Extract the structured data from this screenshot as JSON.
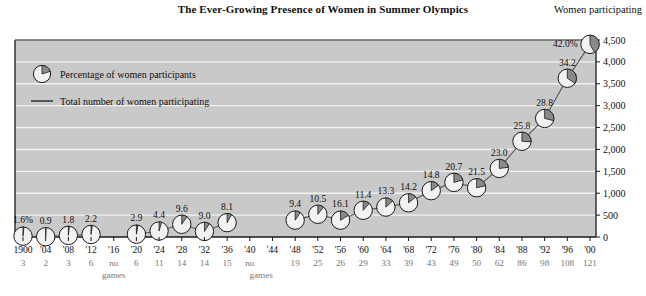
{
  "title": "The Ever-Growing Presence of Women in Summer Olympics",
  "right_axis_header": "Women participating",
  "legend": [
    {
      "key": "pie",
      "label": "Percentage of women participants"
    },
    {
      "key": "line",
      "label": "Total number of women participating"
    }
  ],
  "no_games_label": "no",
  "no_games_label2": "games",
  "colors": {
    "plot_background": "#c9c9c9",
    "gridline": "#f2f2f2",
    "axis": "#1a1a1a",
    "pie_slice": "#8a8a8a",
    "pie_face": "#f2f2f2",
    "series_line": "#555555",
    "text": "#111111",
    "events_text": "#777777"
  },
  "chart_data": {
    "type": "line",
    "title": "The Ever-Growing Presence of Women in Summer Olympics",
    "xlabel": "",
    "ylabel": "Women participating",
    "ylim": [
      0,
      4500
    ],
    "yticks": [
      0,
      500,
      1000,
      1500,
      2000,
      2500,
      3000,
      3500,
      4000,
      4500
    ],
    "ytick_labels": [
      "0",
      "500",
      "1,000",
      "1,500",
      "2,000",
      "2,500",
      "3,000",
      "3,500",
      "4,000",
      "4,500"
    ],
    "grid": true,
    "legend_position": "upper-left-inside",
    "categories": [
      "1900",
      "'04",
      "'08",
      "'12",
      "'16",
      "'20",
      "'24",
      "'28",
      "'32",
      "'36",
      "'40",
      "'44",
      "'48",
      "'52",
      "'56",
      "'60",
      "'64",
      "'68",
      "'72",
      "'76",
      "'80",
      "'84",
      "'88",
      "'92",
      "'96",
      "'00"
    ],
    "series": [
      {
        "name": "Total number of women participating",
        "values": [
          19,
          6,
          36,
          57,
          null,
          64,
          136,
          290,
          127,
          328,
          null,
          null,
          385,
          518,
          384,
          610,
          683,
          781,
          1058,
          1247,
          1125,
          1566,
          2186,
          2708,
          3626,
          4400
        ]
      }
    ],
    "annotations": {
      "name": "Percentage of women participants",
      "labels": [
        "1.6%",
        "0.9",
        "1.8",
        "2.2",
        null,
        "2.9",
        "4.4",
        "9.6",
        "9.0",
        "8.1",
        null,
        null,
        "9.4",
        "10.5",
        "16.1",
        "11.4",
        "13.3",
        "14.2",
        "14.8",
        "20.7",
        "21.5",
        "23.0",
        "25.8",
        "28.8",
        "34.2",
        "42.0%"
      ],
      "values": [
        1.6,
        0.9,
        1.8,
        2.2,
        null,
        2.9,
        4.4,
        9.6,
        9.0,
        8.1,
        null,
        null,
        9.4,
        10.5,
        16.1,
        11.4,
        13.3,
        14.2,
        14.8,
        20.7,
        21.5,
        23.0,
        25.8,
        28.8,
        34.2,
        42.0
      ]
    },
    "events_row": {
      "name": "Number of events open to women",
      "values": [
        "3",
        "2",
        "3",
        "6",
        "no",
        "6",
        "11",
        "14",
        "14",
        "15",
        "no",
        "",
        "19",
        "25",
        "26",
        "29",
        "33",
        "39",
        "43",
        "49",
        "50",
        "62",
        "86",
        "98",
        "108",
        "121"
      ]
    }
  }
}
